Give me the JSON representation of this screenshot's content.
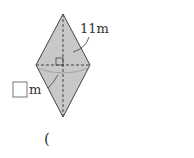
{
  "figure": {
    "shape": "rhombus",
    "fill": "#c8c8c8",
    "edge": "#444444",
    "labels": {
      "side": "11m",
      "unknown_unit": "m",
      "answer_paren": "("
    },
    "answer_box": ""
  }
}
